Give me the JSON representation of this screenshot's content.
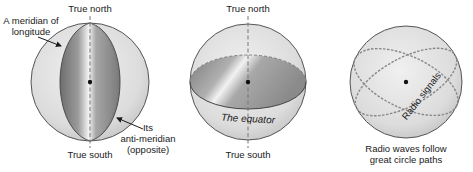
{
  "figure": {
    "panels": [
      {
        "id": "meridian",
        "top_label": "True north",
        "bottom_label": "True south",
        "callout_1": [
          "A meridian of",
          "longitude"
        ],
        "callout_2": [
          "Its",
          "anti-meridian",
          "(opposite)"
        ]
      },
      {
        "id": "equator",
        "top_label": "True north",
        "bottom_label": "True south",
        "equator_label": "The equator"
      },
      {
        "id": "great-circle",
        "signal_label": "Radio signals",
        "caption": [
          "Radio waves follow",
          "great circle paths"
        ]
      }
    ],
    "colors": {
      "sphere_fill": "#e3e3e3",
      "sphere_stroke": "#555555",
      "shade_dark": "#8c8c8c",
      "shade_light": "#f2f2f2",
      "dashed": "#777777",
      "text": "#1a1a1a"
    }
  }
}
